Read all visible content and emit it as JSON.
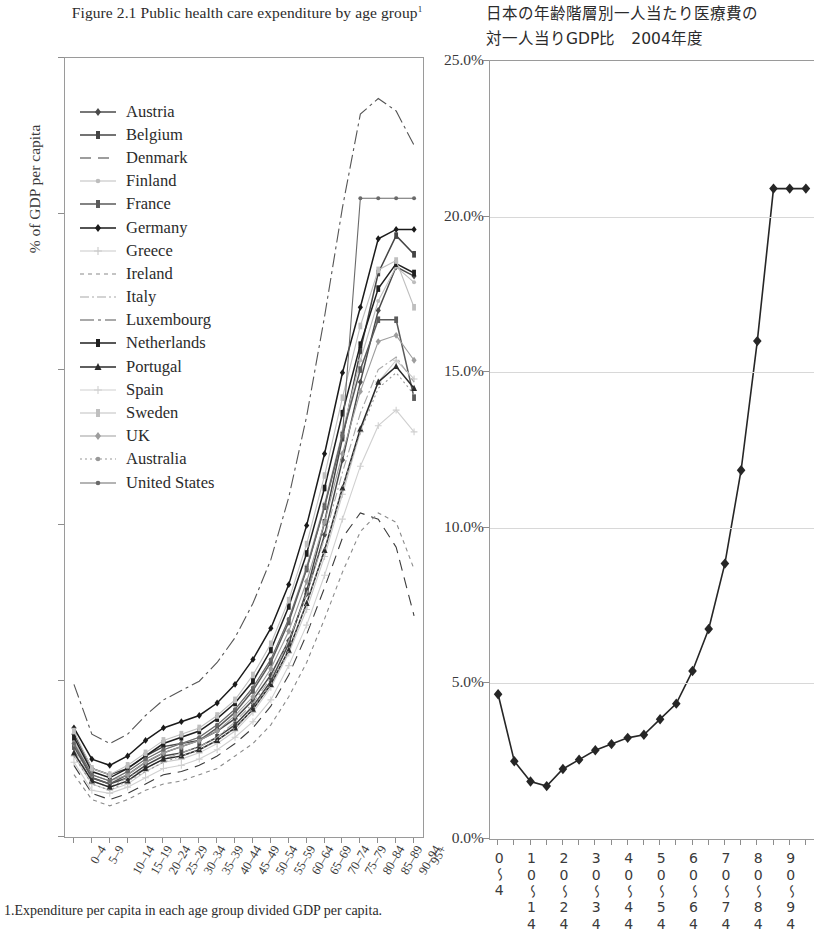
{
  "left": {
    "title": "Figure 2.1 Public health care expenditure by age group",
    "title_superscript": "1",
    "ylabel": "% of GDP per capita",
    "footnote": "1.Expenditure per capita in each age group divided GDP per capita.",
    "legend_title": ""
  },
  "right": {
    "title_line1": "日本の年齢階層別一人当たり医療費の",
    "title_line2": "対一人当りGDP比　2004年度"
  },
  "chart_data": [
    {
      "type": "line",
      "id": "left-chart",
      "title": "Figure 2.1 Public health care expenditure by age group",
      "xlabel": "",
      "ylabel": "% of GDP per capita",
      "ylim": [
        0.0,
        25.0
      ],
      "yticks": [
        "0.0",
        "5.0",
        "10.0",
        "15.0",
        "20.0",
        "25.0"
      ],
      "grid": false,
      "legend_position": "upper-left-inside",
      "categories": [
        "0-4",
        "5-9",
        "10-14",
        "15-19",
        "20-24",
        "25-29",
        "30-34",
        "35-39",
        "40-44",
        "45-49",
        "50-54",
        "55-59",
        "60-64",
        "65-69",
        "70-74",
        "75-79",
        "80-84",
        "85-89",
        "90-94",
        "95+"
      ],
      "series": [
        {
          "name": "Austria",
          "style": "solid-diamond",
          "color": "#4a4a4a",
          "values": [
            3.3,
            2.2,
            2.0,
            2.2,
            2.6,
            2.9,
            3.0,
            3.1,
            3.4,
            3.8,
            4.4,
            5.2,
            6.3,
            7.8,
            9.7,
            12.1,
            14.6,
            16.9,
            18.3,
            18.0
          ]
        },
        {
          "name": "Belgium",
          "style": "solid-square",
          "color": "#454545",
          "values": [
            3.0,
            1.9,
            1.7,
            1.9,
            2.3,
            2.6,
            2.7,
            2.9,
            3.2,
            3.6,
            4.2,
            5.0,
            6.2,
            7.9,
            10.1,
            12.8,
            15.6,
            18.1,
            19.3,
            18.7
          ]
        },
        {
          "name": "Denmark",
          "style": "dashed",
          "color": "#3c3c3c",
          "values": [
            2.3,
            1.4,
            1.2,
            1.4,
            1.7,
            2.0,
            2.1,
            2.3,
            2.6,
            3.0,
            3.5,
            4.2,
            5.2,
            6.5,
            8.0,
            9.6,
            10.4,
            10.2,
            9.3,
            7.1
          ]
        },
        {
          "name": "Finland",
          "style": "solid-light",
          "color": "#bdbdbd",
          "values": [
            3.1,
            2.0,
            1.8,
            2.1,
            2.5,
            2.8,
            3.0,
            3.2,
            3.6,
            4.1,
            4.8,
            5.7,
            7.0,
            8.7,
            10.7,
            13.0,
            15.3,
            17.2,
            18.3,
            17.8
          ]
        },
        {
          "name": "France",
          "style": "solid-bar",
          "color": "#5a5a5a",
          "values": [
            2.9,
            1.9,
            1.7,
            2.0,
            2.4,
            2.7,
            2.9,
            3.1,
            3.5,
            4.0,
            4.7,
            5.6,
            6.9,
            8.6,
            10.6,
            12.9,
            15.0,
            16.6,
            16.6,
            14.1
          ]
        },
        {
          "name": "Germany",
          "style": "bold-diamond",
          "color": "#1a1a1a",
          "values": [
            3.5,
            2.5,
            2.3,
            2.6,
            3.1,
            3.5,
            3.7,
            3.9,
            4.3,
            4.9,
            5.7,
            6.7,
            8.1,
            10.0,
            12.3,
            14.9,
            17.0,
            19.2,
            19.5,
            19.5
          ]
        },
        {
          "name": "Greece",
          "style": "plus-light",
          "color": "#c9c9c9",
          "values": [
            2.6,
            1.7,
            1.5,
            1.7,
            2.1,
            2.4,
            2.5,
            2.7,
            3.0,
            3.4,
            4.0,
            4.8,
            5.9,
            7.3,
            9.0,
            11.0,
            13.0,
            14.6,
            15.3,
            14.7
          ]
        },
        {
          "name": "Ireland",
          "style": "fine-dash",
          "color": "#8a8a8a",
          "values": [
            2.0,
            1.2,
            1.0,
            1.2,
            1.5,
            1.7,
            1.8,
            2.0,
            2.2,
            2.6,
            3.0,
            3.6,
            4.5,
            5.6,
            7.0,
            8.5,
            9.8,
            10.4,
            10.1,
            8.6
          ]
        },
        {
          "name": "Italy",
          "style": "dash-dot-light",
          "color": "#a8a8a8",
          "values": [
            2.8,
            1.8,
            1.6,
            1.9,
            2.2,
            2.5,
            2.7,
            2.9,
            3.2,
            3.7,
            4.3,
            5.1,
            6.3,
            7.8,
            9.6,
            11.7,
            13.6,
            15.0,
            15.4,
            14.6
          ]
        },
        {
          "name": "Luxembourg",
          "style": "dash-dot",
          "color": "#555555",
          "values": [
            4.9,
            3.3,
            3.0,
            3.3,
            3.9,
            4.4,
            4.7,
            5.0,
            5.6,
            6.4,
            7.5,
            8.9,
            10.9,
            13.5,
            16.7,
            20.2,
            23.2,
            23.7,
            23.3,
            22.2
          ]
        },
        {
          "name": "Netherlands",
          "style": "bold-square",
          "color": "#1f1f1f",
          "values": [
            3.2,
            2.1,
            1.9,
            2.2,
            2.6,
            3.0,
            3.2,
            3.4,
            3.8,
            4.3,
            5.0,
            6.0,
            7.4,
            9.1,
            11.2,
            13.6,
            15.8,
            17.6,
            18.4,
            18.1
          ]
        },
        {
          "name": "Portugal",
          "style": "bold-tri",
          "color": "#2a2a2a",
          "values": [
            2.7,
            1.8,
            1.6,
            1.8,
            2.2,
            2.5,
            2.6,
            2.8,
            3.1,
            3.5,
            4.1,
            4.9,
            6.0,
            7.5,
            9.2,
            11.2,
            13.1,
            14.6,
            15.1,
            14.4
          ]
        },
        {
          "name": "Spain",
          "style": "plus-pale",
          "color": "#d0d0d0",
          "values": [
            2.4,
            1.5,
            1.4,
            1.6,
            1.9,
            2.2,
            2.3,
            2.5,
            2.8,
            3.2,
            3.7,
            4.4,
            5.5,
            6.8,
            8.4,
            10.2,
            11.9,
            13.2,
            13.7,
            13.0
          ]
        },
        {
          "name": "Sweden",
          "style": "bar-light",
          "color": "#bfbfbf",
          "values": [
            3.4,
            2.2,
            2.0,
            2.3,
            2.7,
            3.1,
            3.3,
            3.5,
            3.9,
            4.4,
            5.2,
            6.2,
            7.6,
            9.4,
            11.6,
            14.1,
            16.4,
            18.2,
            18.5,
            17.0
          ]
        },
        {
          "name": "UK",
          "style": "diamond-mid",
          "color": "#9d9d9d",
          "values": [
            3.0,
            2.0,
            1.8,
            2.0,
            2.4,
            2.7,
            2.9,
            3.1,
            3.4,
            3.9,
            4.5,
            5.4,
            6.6,
            8.2,
            10.1,
            12.3,
            14.3,
            15.9,
            16.1,
            15.3
          ]
        },
        {
          "name": "Australia",
          "style": "dot-mid",
          "color": "#989898",
          "values": [
            2.6,
            1.7,
            1.5,
            1.8,
            2.1,
            2.4,
            2.6,
            2.8,
            3.1,
            3.5,
            4.1,
            4.9,
            6.0,
            7.5,
            9.2,
            11.2,
            13.0,
            14.4,
            14.9,
            14.2
          ]
        },
        {
          "name": "United States",
          "style": "solid-dot",
          "color": "#6a6a6a",
          "values": [
            3.0,
            2.0,
            1.8,
            2.1,
            2.5,
            2.8,
            3.0,
            3.2,
            3.6,
            4.1,
            4.8,
            5.7,
            7.0,
            8.6,
            10.6,
            12.9,
            20.5,
            20.5,
            20.5,
            20.5
          ]
        }
      ]
    },
    {
      "type": "line",
      "id": "right-chart",
      "title": "日本の年齢階層別一人当たり医療費の対一人当りGDP比　2004年度",
      "xlabel": "",
      "ylabel": "",
      "ylim": [
        0.0,
        25.0
      ],
      "yticks": [
        "0.0%",
        "5.0%",
        "10.0%",
        "15.0%",
        "20.0%",
        "25.0%"
      ],
      "grid": true,
      "categories": [
        "0〜4",
        "5〜9",
        "10〜14",
        "15〜19",
        "20〜24",
        "25〜29",
        "30〜34",
        "35〜39",
        "40〜44",
        "45〜49",
        "50〜54",
        "55〜59",
        "60〜64",
        "65〜69",
        "70〜74",
        "75〜79",
        "80〜84",
        "85〜89",
        "90〜94",
        "95〜"
      ],
      "xtick_labels": [
        "0〜4",
        "10〜14",
        "20〜24",
        "30〜34",
        "40〜44",
        "50〜54",
        "60〜64",
        "70〜74",
        "80〜84",
        "90〜94"
      ],
      "series": [
        {
          "name": "日本",
          "style": "solid-diamond",
          "color": "#262626",
          "values": [
            4.65,
            2.5,
            1.85,
            1.7,
            2.25,
            2.55,
            2.85,
            3.05,
            3.25,
            3.35,
            3.85,
            4.35,
            5.4,
            6.75,
            8.85,
            11.85,
            16.0,
            20.9,
            20.9,
            20.9
          ]
        }
      ]
    }
  ]
}
